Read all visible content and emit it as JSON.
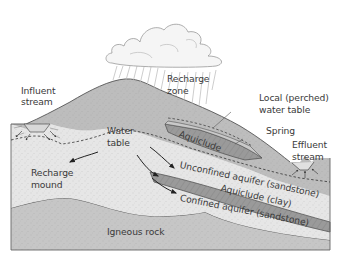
{
  "diagram": {
    "type": "groundwater cross-section",
    "labels": {
      "influent_stream_1": "Influent",
      "influent_stream_2": "stream",
      "recharge_zone_1": "Recharge",
      "recharge_zone_2": "zone",
      "local_water_table_1": "Local (perched)",
      "local_water_table_2": "water table",
      "spring": "Spring",
      "effluent_stream_1": "Effluent",
      "effluent_stream_2": "stream",
      "water_table_1": "Water",
      "water_table_2": "table",
      "aquiclude_upper": "Aquiclude",
      "unconfined_aquifer": "Unconfined aquifer (sandstone)",
      "aquiclude_clay": "Aquiclude (clay)",
      "confined_aquifer": "Confined aquifer (sandstone)",
      "recharge_mound_1": "Recharge",
      "recharge_mound_2": "mound",
      "igneous_rock": "Igneous rock"
    },
    "colors": {
      "surface_layer": "#b9b9b9",
      "aquifer": "#e4e4e4",
      "aquiclude": "#8f8f8f",
      "igneous": "#c6c6c6",
      "cloud": "#f4f4f4",
      "outline": "#555555",
      "text": "#3a3a3a"
    }
  }
}
